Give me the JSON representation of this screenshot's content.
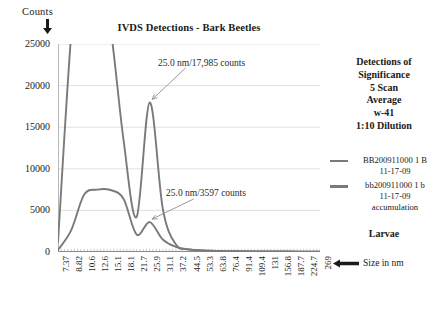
{
  "axis_caption_y": "Counts",
  "axis_caption_x": "Size in nm",
  "icons": {
    "y_arrow": "arrow-down-icon",
    "x_arrow": "arrow-left-icon",
    "anno_arrow": "callout-arrow-icon"
  },
  "panel": {
    "heading_lines": [
      "Detections of",
      "Significance",
      "5 Scan",
      "Average",
      "w-41",
      "1:10 Dilution"
    ],
    "footer": "Larvae"
  },
  "colors": {
    "series": "#7a7a7a",
    "grid": "#d9d9d9",
    "text": "#1a1a1a"
  },
  "chart_data": {
    "type": "line",
    "title": "IVDS Detections - Bark Beetles",
    "xlabel": "Size in nm",
    "ylabel": "Counts",
    "ylim": [
      0,
      25000
    ],
    "yticks": [
      0,
      5000,
      10000,
      15000,
      20000,
      25000
    ],
    "ytick_labels": [
      "0",
      "5000",
      "10000",
      "15000",
      "20000",
      "25000"
    ],
    "grid": true,
    "legend_position": "right",
    "categories": [
      "7.37",
      "8.82",
      "10.6",
      "12.6",
      "15.1",
      "18.1",
      "21.7",
      "25.9",
      "31.1",
      "37.2",
      "44.5",
      "53.3",
      "63.8",
      "76.4",
      "91.4",
      "109.4",
      "131",
      "156.8",
      "187.7",
      "224.7",
      "269"
    ],
    "series": [
      {
        "name": "BB200911000 1 B 11-17-09",
        "color": "#7a7a7a",
        "values": [
          1200,
          26000,
          42000,
          34000,
          27000,
          13500,
          4200,
          17985,
          5200,
          900,
          320,
          180,
          120,
          95,
          80,
          70,
          60,
          55,
          50,
          45,
          40
        ]
      },
      {
        "name": "bb200911000 1 b 11-17-09 accumulation",
        "color": "#7a7a7a",
        "values": [
          250,
          2600,
          6900,
          7500,
          7450,
          6400,
          2100,
          3597,
          1500,
          620,
          300,
          190,
          140,
          110,
          90,
          78,
          68,
          60,
          54,
          48,
          44
        ]
      }
    ],
    "annotations": [
      {
        "text": "25.0 nm/17,985 counts",
        "x_value": "25.9",
        "y_value": 17985
      },
      {
        "text": "25.0 nm/3597 counts",
        "x_value": "25.9",
        "y_value": 3597
      }
    ]
  },
  "legend": [
    {
      "line1": "BB200911000 1 B",
      "line2": "11-17-09",
      "line3": ""
    },
    {
      "line1": "bb200911000 1 b",
      "line2": "11-17-09",
      "line3": "accumulation"
    }
  ]
}
